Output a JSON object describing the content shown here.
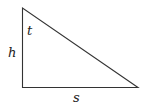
{
  "diagram": {
    "type": "right-triangle",
    "labels": {
      "angle": "t",
      "height": "h",
      "base": "s"
    },
    "colors": {
      "stroke": "#333333",
      "text": "#222222",
      "background": "#ffffff"
    }
  }
}
